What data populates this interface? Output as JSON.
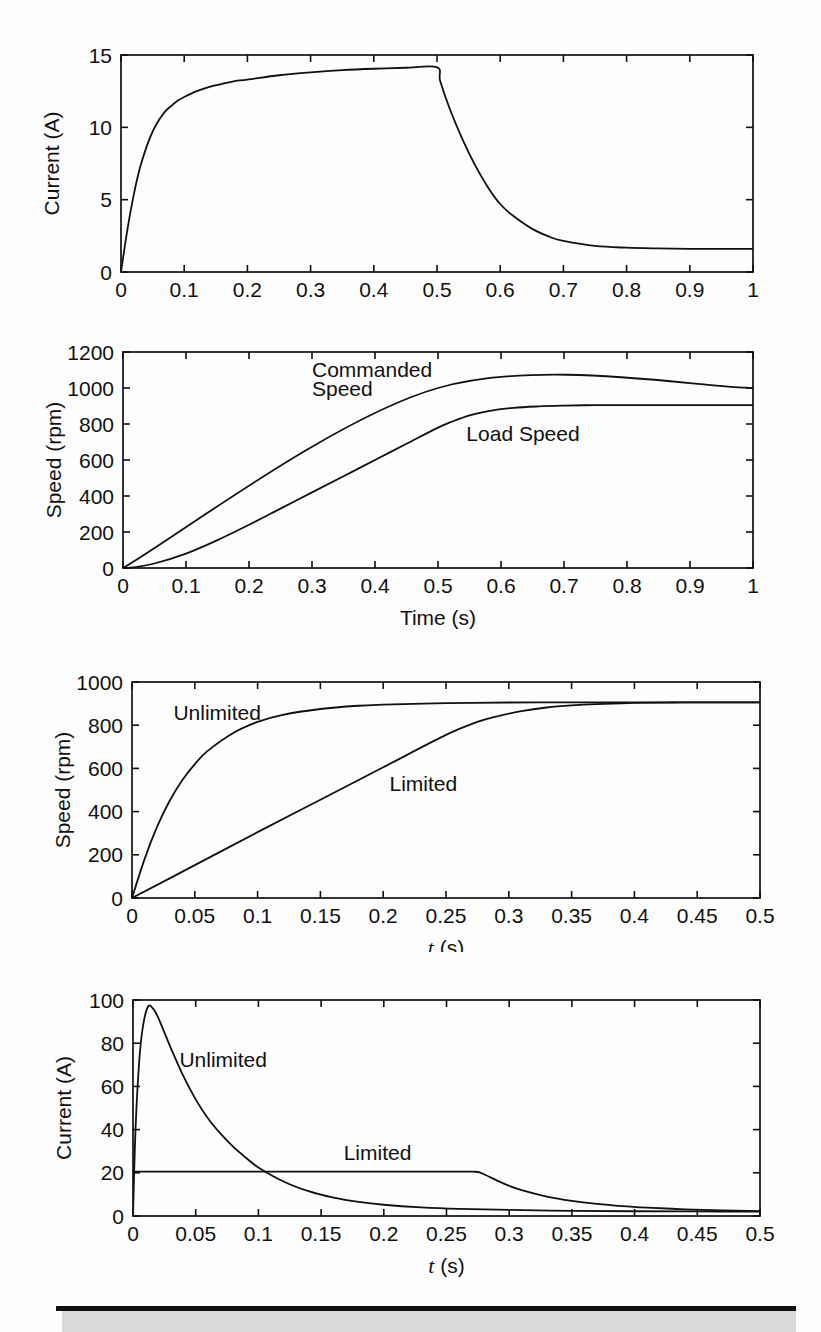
{
  "footer": {
    "bar_color": "#111111",
    "panel_color": "#d9d9d9"
  },
  "chart_data": [
    {
      "id": "current-vs-time",
      "type": "line",
      "title": "",
      "xlabel": "",
      "ylabel": "Current (A)",
      "xlim": [
        0,
        1
      ],
      "ylim": [
        0,
        15
      ],
      "xticks": [
        0,
        0.1,
        0.2,
        0.3,
        0.4,
        0.5,
        0.6,
        0.7,
        0.8,
        0.9,
        1
      ],
      "xticklabels": [
        "0",
        "0.1",
        "0.2",
        "0.3",
        "0.4",
        "0.5",
        "0.6",
        "0.7",
        "0.8",
        "0.9",
        "1"
      ],
      "yticks": [
        0,
        5,
        10,
        15
      ],
      "yticklabels": [
        "0",
        "5",
        "10",
        "15"
      ],
      "grid": false,
      "legend": "none",
      "annotations": [],
      "series": [
        {
          "name": "Armature current",
          "x": [
            0,
            0.01,
            0.02,
            0.03,
            0.04,
            0.05,
            0.06,
            0.07,
            0.08,
            0.09,
            0.1,
            0.12,
            0.14,
            0.16,
            0.18,
            0.2,
            0.25,
            0.3,
            0.35,
            0.4,
            0.45,
            0.5,
            0.505,
            0.52,
            0.54,
            0.56,
            0.58,
            0.6,
            0.62,
            0.65,
            0.68,
            0.7,
            0.75,
            0.8,
            0.85,
            0.9,
            0.95,
            1
          ],
          "y": [
            0,
            2.9,
            5.3,
            7.2,
            8.6,
            9.7,
            10.5,
            11.1,
            11.5,
            11.85,
            12.1,
            12.5,
            12.8,
            13.0,
            13.2,
            13.3,
            13.6,
            13.8,
            13.95,
            14.05,
            14.12,
            14.15,
            13.2,
            11.3,
            9.2,
            7.4,
            5.9,
            4.7,
            3.9,
            3.0,
            2.4,
            2.15,
            1.8,
            1.68,
            1.63,
            1.6,
            1.6,
            1.6
          ]
        }
      ]
    },
    {
      "id": "speed-vs-time",
      "type": "line",
      "title": "",
      "xlabel": "Time (s)",
      "ylabel": "Speed (rpm)",
      "xlim": [
        0,
        1
      ],
      "ylim": [
        0,
        1200
      ],
      "xticks": [
        0,
        0.1,
        0.2,
        0.3,
        0.4,
        0.5,
        0.6,
        0.7,
        0.8,
        0.9,
        1
      ],
      "xticklabels": [
        "0",
        "0.1",
        "0.2",
        "0.3",
        "0.4",
        "0.5",
        "0.6",
        "0.7",
        "0.8",
        "0.9",
        "1"
      ],
      "yticks": [
        0,
        200,
        400,
        600,
        800,
        1000,
        1200
      ],
      "yticklabels": [
        "0",
        "200",
        "400",
        "600",
        "800",
        "1000",
        "1200"
      ],
      "grid": false,
      "legend": "inline-annotations",
      "annotations": [
        {
          "text": "Commanded",
          "x": 0.3,
          "y": 1100
        },
        {
          "text": "Speed",
          "x": 0.3,
          "y": 995
        },
        {
          "text": "Load Speed",
          "x": 0.545,
          "y": 745
        }
      ],
      "series": [
        {
          "name": "Commanded Speed",
          "x": [
            0,
            0.5,
            1
          ],
          "y": [
            0,
            1000,
            1000
          ]
        },
        {
          "name": "Load Speed",
          "x": [
            0,
            0.02,
            0.05,
            0.1,
            0.15,
            0.2,
            0.25,
            0.3,
            0.35,
            0.4,
            0.45,
            0.5,
            0.52,
            0.55,
            0.58,
            0.62,
            0.66,
            0.7,
            0.75,
            0.8,
            0.9,
            1
          ],
          "y": [
            0,
            5,
            25,
            80,
            155,
            240,
            330,
            420,
            510,
            600,
            690,
            780,
            810,
            848,
            872,
            890,
            898,
            902,
            905,
            905,
            905,
            905
          ]
        }
      ]
    },
    {
      "id": "speed-limited-vs-unlimited",
      "type": "line",
      "title": "",
      "xlabel": "t (s)",
      "xlabel_italic_prefix": "t",
      "xlabel_suffix": " (s)",
      "ylabel": "Speed (rpm)",
      "xlim": [
        0,
        0.5
      ],
      "ylim": [
        0,
        1000
      ],
      "xticks": [
        0,
        0.05,
        0.1,
        0.15,
        0.2,
        0.25,
        0.3,
        0.35,
        0.4,
        0.45,
        0.5
      ],
      "xticklabels": [
        "0",
        "0.05",
        "0.1",
        "0.15",
        "0.2",
        "0.25",
        "0.3",
        "0.35",
        "0.4",
        "0.45",
        "0.5"
      ],
      "yticks": [
        0,
        200,
        400,
        600,
        800,
        1000
      ],
      "yticklabels": [
        "0",
        "200",
        "400",
        "600",
        "800",
        "1000"
      ],
      "grid": false,
      "legend": "inline-annotations",
      "annotations": [
        {
          "text": "Unlimited",
          "x": 0.033,
          "y": 855
        },
        {
          "text": "Limited",
          "x": 0.205,
          "y": 530
        }
      ],
      "series": [
        {
          "name": "Unlimited",
          "x": [
            0,
            0.01,
            0.02,
            0.03,
            0.04,
            0.05,
            0.06,
            0.08,
            0.1,
            0.12,
            0.15,
            0.18,
            0.2,
            0.25,
            0.3,
            0.35,
            0.4,
            0.45,
            0.5
          ],
          "y": [
            0,
            180,
            330,
            450,
            545,
            620,
            680,
            762,
            815,
            848,
            875,
            890,
            895,
            902,
            905,
            906,
            906,
            906,
            906
          ]
        },
        {
          "name": "Limited",
          "x": [
            0,
            0.05,
            0.1,
            0.15,
            0.2,
            0.25,
            0.275,
            0.29,
            0.31,
            0.33,
            0.35,
            0.37,
            0.4,
            0.43,
            0.46,
            0.5
          ],
          "y": [
            0,
            152,
            305,
            455,
            605,
            755,
            815,
            840,
            865,
            882,
            892,
            898,
            903,
            905,
            906,
            906
          ]
        }
      ]
    },
    {
      "id": "current-limited-vs-unlimited",
      "type": "line",
      "title": "",
      "xlabel": "t (s)",
      "xlabel_italic_prefix": "t",
      "xlabel_suffix": " (s)",
      "ylabel": "Current (A)",
      "xlim": [
        0,
        0.5
      ],
      "ylim": [
        0,
        100
      ],
      "xticks": [
        0,
        0.05,
        0.1,
        0.15,
        0.2,
        0.25,
        0.3,
        0.35,
        0.4,
        0.45,
        0.5
      ],
      "xticklabels": [
        "0",
        "0.05",
        "0.1",
        "0.15",
        "0.2",
        "0.25",
        "0.3",
        "0.35",
        "0.4",
        "0.45",
        "0.5"
      ],
      "yticks": [
        0,
        20,
        40,
        60,
        80,
        100
      ],
      "yticklabels": [
        "0",
        "20",
        "40",
        "60",
        "80",
        "100"
      ],
      "grid": false,
      "legend": "inline-annotations",
      "annotations": [
        {
          "text": "Unlimited",
          "x": 0.037,
          "y": 72
        },
        {
          "text": "Limited",
          "x": 0.168,
          "y": 29
        }
      ],
      "series": [
        {
          "name": "Unlimited",
          "x": [
            0,
            0.002,
            0.005,
            0.008,
            0.012,
            0.016,
            0.02,
            0.025,
            0.03,
            0.04,
            0.05,
            0.06,
            0.07,
            0.08,
            0.09,
            0.1,
            0.12,
            0.14,
            0.16,
            0.18,
            0.2,
            0.23,
            0.26,
            0.3,
            0.35,
            0.4,
            0.45,
            0.5
          ],
          "y": [
            0,
            40,
            72,
            88,
            97,
            96,
            92,
            85,
            78,
            65,
            54,
            45,
            38,
            32,
            27,
            22.5,
            16,
            11.5,
            8.5,
            6.5,
            5.2,
            4.0,
            3.3,
            2.8,
            2.4,
            2.2,
            2.1,
            2.0
          ]
        },
        {
          "name": "Limited",
          "x": [
            0,
            0.05,
            0.1,
            0.15,
            0.2,
            0.25,
            0.272,
            0.278,
            0.29,
            0.3,
            0.31,
            0.33,
            0.35,
            0.37,
            0.39,
            0.41,
            0.44,
            0.47,
            0.5
          ],
          "y": [
            20.5,
            20.5,
            20.5,
            20.5,
            20.5,
            20.5,
            20.5,
            19.8,
            16.5,
            14.0,
            12.0,
            9.0,
            7.0,
            5.6,
            4.6,
            3.9,
            3.1,
            2.6,
            2.3
          ]
        }
      ]
    }
  ]
}
